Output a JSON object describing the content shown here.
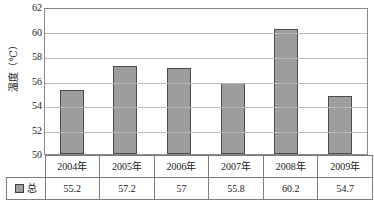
{
  "chart_data": {
    "type": "bar",
    "title": "",
    "xlabel": "",
    "ylabel": "温度（℃）",
    "categories": [
      "2004年",
      "2005年",
      "2006年",
      "2007年",
      "2008年",
      "2009年"
    ],
    "values": [
      55.2,
      57.2,
      57,
      55.8,
      60.2,
      54.7
    ],
    "value_labels": [
      "55.2",
      "57.2",
      "57",
      "55.8",
      "60.2",
      "54.7"
    ],
    "series": [
      {
        "name": "总",
        "values": [
          55.2,
          57.2,
          57,
          55.8,
          60.2,
          54.7
        ],
        "color": "#9d9d9d"
      }
    ],
    "ylim": [
      50,
      62
    ],
    "ytick_labels": [
      "62",
      "60",
      "58",
      "56",
      "54",
      "52",
      "50"
    ],
    "yticks": [
      62,
      60,
      58,
      56,
      54,
      52,
      50
    ],
    "grid": true,
    "legend_position": "table-left"
  },
  "legend": {
    "swatch_name": "series-color-swatch",
    "label": "总"
  },
  "colors": {
    "bar_fill": "#9d9d9d",
    "bar_stroke": "#4d4d4d",
    "gridline": "#b9b9b9",
    "plot_border": "#888888",
    "table_border": "#7d7d7d",
    "background": "#ffffff"
  }
}
